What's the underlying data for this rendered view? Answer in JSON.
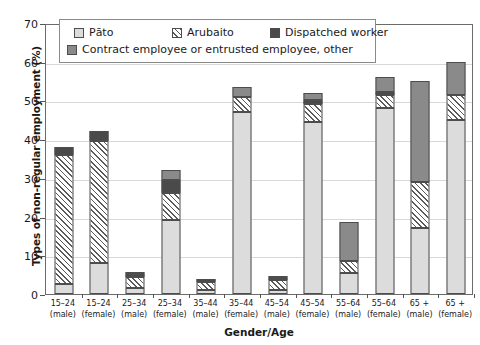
{
  "chart_data": {
    "type": "bar",
    "stacked": true,
    "title": "",
    "xlabel": "Gender/Age",
    "ylabel": "Types of non-regular employment (%)",
    "ylim": [
      0,
      70
    ],
    "yticks": [
      0,
      10,
      20,
      30,
      40,
      50,
      60,
      70
    ],
    "grid": "horizontal",
    "legend_position": "top-left-inside",
    "categories": [
      "15–24 (male)",
      "15–24 (female)",
      "25–34 (male)",
      "25–34 (female)",
      "35–44 (male)",
      "35–44 (female)",
      "45–54 (male)",
      "45–54 (female)",
      "55–64 (male)",
      "55–64 (female)",
      "65 + (male)",
      "65 + (female)"
    ],
    "category_parts": [
      {
        "age": "15–24",
        "sex": "(male)"
      },
      {
        "age": "15–24",
        "sex": "(female)"
      },
      {
        "age": "25–34",
        "sex": "(male)"
      },
      {
        "age": "25–34",
        "sex": "(female)"
      },
      {
        "age": "35–44",
        "sex": "(male)"
      },
      {
        "age": "35–44",
        "sex": "(female)"
      },
      {
        "age": "45–54",
        "sex": "(male)"
      },
      {
        "age": "45–54",
        "sex": "(female)"
      },
      {
        "age": "55–64",
        "sex": "(male)"
      },
      {
        "age": "55–64",
        "sex": "(female)"
      },
      {
        "age": "65 +",
        "sex": "(male)"
      },
      {
        "age": "65 +",
        "sex": "(female)"
      }
    ],
    "series": [
      {
        "name": "Pāto",
        "key": "pato",
        "color": "#dcdcdc",
        "pattern": "solid-light",
        "values": [
          2.5,
          8.0,
          1.5,
          19.0,
          1.0,
          47.0,
          1.0,
          44.5,
          5.5,
          48.0,
          17.0,
          45.0
        ]
      },
      {
        "name": "Arubaito",
        "key": "arubaito",
        "color": "#ffffff",
        "pattern": "diagonal-hatch",
        "values": [
          33.5,
          31.5,
          3.0,
          7.0,
          2.0,
          4.0,
          2.5,
          4.5,
          3.0,
          3.5,
          12.0,
          6.5
        ]
      },
      {
        "name": "Dispatched worker",
        "key": "dispatched",
        "color": "#4a4a4a",
        "pattern": "solid-dark",
        "values": [
          2.0,
          2.5,
          0.6,
          3.5,
          1.0,
          0.0,
          0.6,
          1.0,
          0.0,
          0.8,
          0.0,
          0.0
        ]
      },
      {
        "name": "Contract employee or entrusted employee, other",
        "key": "contract",
        "color": "#8a8a8a",
        "pattern": "solid-mid",
        "values": [
          0.0,
          0.0,
          0.7,
          2.5,
          0.0,
          2.5,
          0.5,
          2.0,
          10.0,
          3.7,
          26.0,
          8.5
        ]
      }
    ],
    "totals": [
      38.0,
      42.0,
      5.8,
      32.0,
      4.0,
      53.5,
      4.6,
      52.0,
      18.5,
      56.0,
      55.0,
      60.0
    ]
  },
  "legend": {
    "rows": [
      [
        {
          "label": "Pāto",
          "key": "pato"
        },
        {
          "label": "Arubaito",
          "key": "arubaito"
        },
        {
          "label": "Dispatched worker",
          "key": "dispatched"
        }
      ],
      [
        {
          "label": "Contract employee or entrusted employee, other",
          "key": "contract"
        }
      ]
    ]
  },
  "axes": {
    "y_title": "Types of non-regular employment (%)",
    "x_title": "Gender/Age",
    "y_tick_labels": [
      "0",
      "10",
      "20",
      "30",
      "40",
      "50",
      "60",
      "70"
    ]
  }
}
